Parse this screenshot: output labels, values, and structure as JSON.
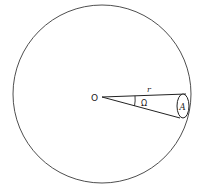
{
  "diagram": {
    "labels": {
      "center": "O",
      "radius": "r",
      "solid_angle": "Ω",
      "area": "A"
    },
    "colors": {
      "line": "#3a3a3a",
      "stipple": "#2a2a2a",
      "background": "#ffffff"
    },
    "geometry": {
      "sphere_center": [
        102,
        94
      ],
      "sphere_radius": 89,
      "apex": [
        102,
        97
      ],
      "cone_top_end": [
        186,
        94
      ],
      "cone_bottom_end": [
        180,
        118
      ],
      "area_ellipse_center": [
        183,
        106
      ],
      "area_ellipse_rx": 6,
      "area_ellipse_ry": 12
    }
  }
}
